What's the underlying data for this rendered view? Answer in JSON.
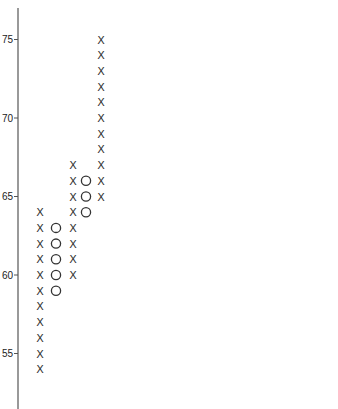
{
  "chart_data": {
    "type": "point-and-figure",
    "title": "",
    "xlabel": "",
    "ylabel": "",
    "ylim": [
      52,
      77
    ],
    "yticks": [
      55,
      60,
      65,
      70,
      75
    ],
    "box_size": 1,
    "grid": false,
    "legend": null,
    "columns": [
      {
        "index": 1,
        "symbol": "X",
        "direction": "up",
        "from": 54,
        "to": 64,
        "values": [
          54,
          55,
          56,
          57,
          58,
          59,
          60,
          61,
          62,
          63,
          64
        ]
      },
      {
        "index": 2,
        "symbol": "O",
        "direction": "down",
        "from": 63,
        "to": 59,
        "values": [
          63,
          62,
          61,
          60,
          59
        ]
      },
      {
        "index": 3,
        "symbol": "X",
        "direction": "up",
        "from": 60,
        "to": 67,
        "values": [
          60,
          61,
          62,
          63,
          64,
          65,
          66,
          67
        ]
      },
      {
        "index": 4,
        "symbol": "O",
        "direction": "down",
        "from": 66,
        "to": 64,
        "values": [
          66,
          65,
          64
        ]
      },
      {
        "index": 5,
        "symbol": "X",
        "direction": "up",
        "from": 65,
        "to": 75,
        "values": [
          65,
          66,
          67,
          68,
          69,
          70,
          71,
          72,
          73,
          74,
          75
        ]
      }
    ]
  },
  "axis": {
    "color": "#555555",
    "tick_labels": [
      "55",
      "60",
      "65",
      "70",
      "75"
    ]
  },
  "symbols": {
    "x": "X",
    "o": "O"
  }
}
